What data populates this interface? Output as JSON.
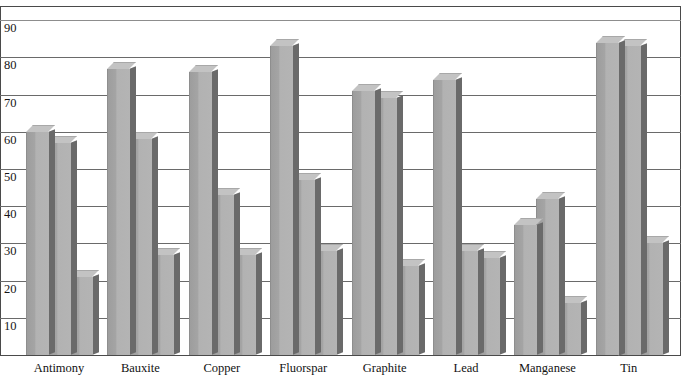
{
  "chart_data": {
    "type": "bar",
    "title": "",
    "xlabel": "",
    "ylabel": "",
    "ylim": [
      0,
      90
    ],
    "grid": true,
    "legend": "none",
    "style": "3d-grouped-bar-grayscale",
    "categories": [
      "Antimony",
      "Bauxite",
      "Copper",
      "Fluorspar",
      "Graphite",
      "Lead",
      "Manganese",
      "Tin"
    ],
    "ytick_labels": [
      "90",
      "80",
      "70",
      "60",
      "50",
      "40",
      "30",
      "20",
      "10"
    ],
    "ytick_values": [
      90,
      80,
      70,
      60,
      50,
      40,
      30,
      20,
      10
    ],
    "series": [
      {
        "name": "Series 1",
        "values": [
          60,
          77,
          76,
          83,
          71,
          74,
          35,
          84
        ]
      },
      {
        "name": "Series 2",
        "values": [
          57,
          58,
          43,
          47,
          69,
          28,
          42,
          83
        ]
      },
      {
        "name": "Series 3",
        "values": [
          21,
          27,
          27,
          28,
          24,
          26,
          14,
          30
        ]
      }
    ],
    "colors": {
      "bar_face_left": "#9d9d9d",
      "bar_face_right": "#b4b4b4",
      "bar_top": "#c3c3c3",
      "bar_side": "#6a6a6a",
      "gridline": "#6a6a6a",
      "axis": "#4a4a4a",
      "text": "#151515",
      "background": "#ffffff"
    }
  },
  "axis": {
    "title_remnant": ""
  }
}
